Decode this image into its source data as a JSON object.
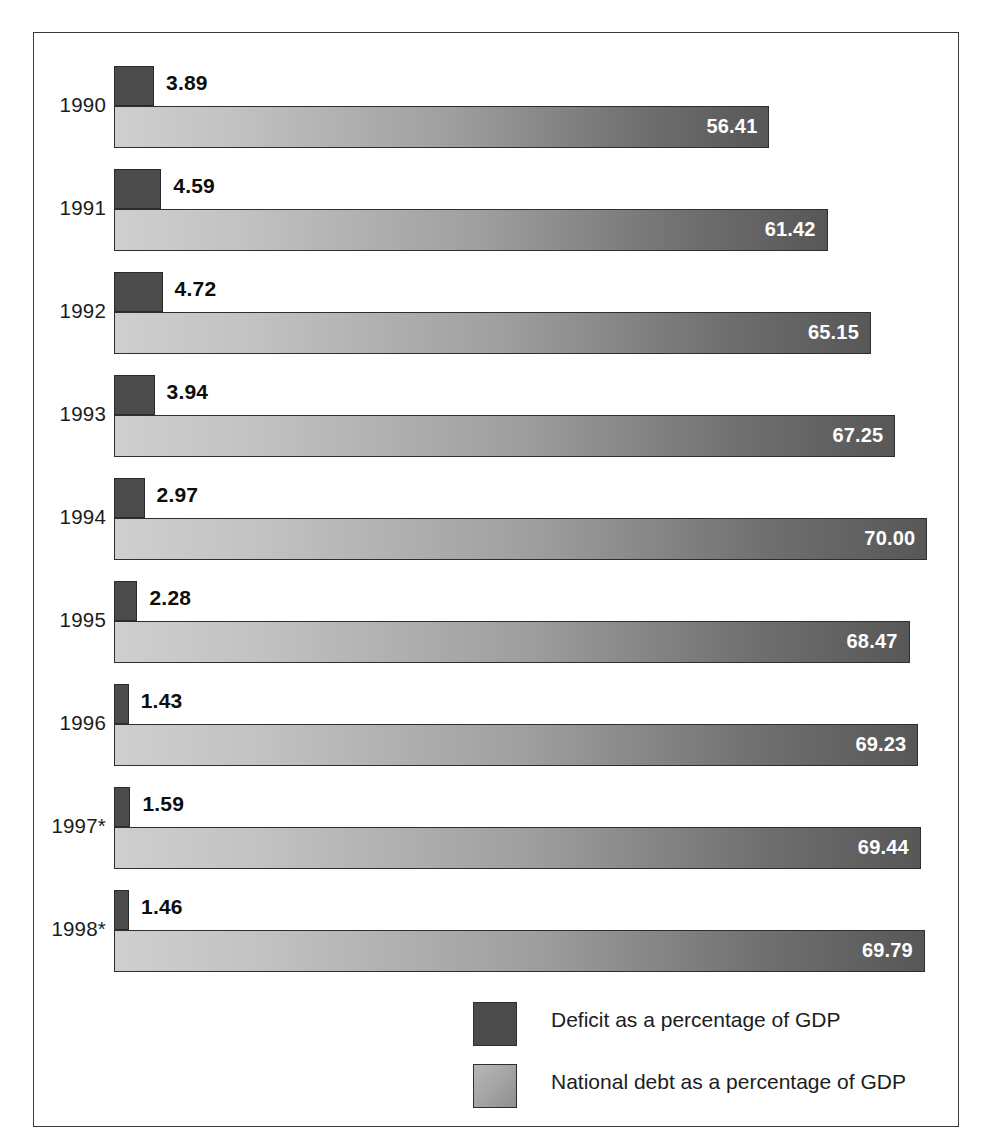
{
  "chart_data": {
    "type": "bar",
    "orientation": "horizontal",
    "title": "",
    "subtitle": "",
    "xlabel": "",
    "ylabel": "",
    "grid": false,
    "legend_position": "bottom-right",
    "categories": [
      "1990",
      "1991",
      "1992",
      "1993",
      "1994",
      "1995",
      "1996",
      "1997*",
      "1998*"
    ],
    "series": [
      {
        "name": "Deficit as a percentage of GDP",
        "color": "#4b4b4b",
        "label_color": "#0d0d0d",
        "values": [
          3.89,
          4.59,
          4.72,
          3.94,
          2.97,
          2.28,
          1.43,
          1.59,
          1.46
        ],
        "value_labels": [
          "3.89",
          "4.59",
          "4.72",
          "3.94",
          "2.97",
          "2.28",
          "1.43",
          "1.59",
          "1.46"
        ],
        "axis_max": 7.0
      },
      {
        "name": "National debt as a percentage of GDP",
        "color": "#9e9e9e",
        "label_color": "#ffffff",
        "values": [
          56.41,
          61.42,
          65.15,
          67.25,
          70.0,
          68.47,
          69.23,
          69.44,
          69.79
        ],
        "value_labels": [
          "56.41",
          "61.42",
          "65.15",
          "67.25",
          "70.00",
          "68.47",
          "69.23",
          "69.44",
          "69.79"
        ],
        "axis_max": 73.5
      }
    ],
    "rows": [
      {
        "year": "1990",
        "deficit": 3.89,
        "deficit_label": "3.89",
        "debt": 56.41,
        "debt_label": "56.41"
      },
      {
        "year": "1991",
        "deficit": 4.59,
        "deficit_label": "4.59",
        "debt": 61.42,
        "debt_label": "61.42"
      },
      {
        "year": "1992",
        "deficit": 4.72,
        "deficit_label": "4.72",
        "debt": 65.15,
        "debt_label": "65.15"
      },
      {
        "year": "1993",
        "deficit": 3.94,
        "deficit_label": "3.94",
        "debt": 67.25,
        "debt_label": "67.25"
      },
      {
        "year": "1994",
        "deficit": 2.97,
        "deficit_label": "2.97",
        "debt": 70.0,
        "debt_label": "70.00"
      },
      {
        "year": "1995",
        "deficit": 2.28,
        "deficit_label": "2.28",
        "debt": 68.47,
        "debt_label": "68.47"
      },
      {
        "year": "1996",
        "deficit": 1.43,
        "deficit_label": "1.43",
        "debt": 69.23,
        "debt_label": "69.23"
      },
      {
        "year": "1997*",
        "deficit": 1.59,
        "deficit_label": "1.59",
        "debt": 69.44,
        "debt_label": "69.44"
      },
      {
        "year": "1998*",
        "deficit": 1.46,
        "deficit_label": "1.46",
        "debt": 69.79,
        "debt_label": "69.79"
      }
    ]
  },
  "legend": {
    "items": [
      {
        "label": "Deficit as a percentage of GDP",
        "swatch": "deficit"
      },
      {
        "label": "National debt as a percentage of GDP",
        "swatch": "debt"
      }
    ]
  },
  "colors": {
    "deficit_bar": "#4b4b4b",
    "debt_bar_light": "#cfcfcf",
    "debt_bar_dark": "#575757",
    "frame_border": "#3a3a3a",
    "background": "#ffffff",
    "text": "#1c1c1c"
  },
  "layout": {
    "bar_origin_x": 80,
    "row_height": 103,
    "first_row_top": 12,
    "deficit_px_per_unit": 10.3,
    "debt_px_per_unit": 11.62
  }
}
